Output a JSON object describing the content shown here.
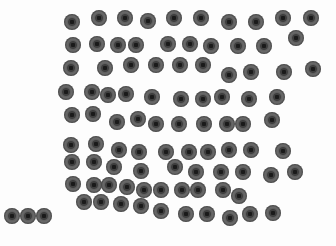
{
  "image": {
    "description": "Top-down photo of dark grey rubber washers/grommets arranged in loose rows on a white background",
    "background_color": "#fdfdfd",
    "washer_color": "#5f5f5f",
    "hole_color": "#1a1a1a",
    "washer_diameter_px": 16,
    "washer_count": 93
  },
  "washers": [
    [
      72,
      22
    ],
    [
      99,
      18
    ],
    [
      125,
      18
    ],
    [
      148,
      21
    ],
    [
      174,
      18
    ],
    [
      201,
      18
    ],
    [
      229,
      22
    ],
    [
      256,
      22
    ],
    [
      283,
      18
    ],
    [
      311,
      18
    ],
    [
      73,
      45
    ],
    [
      97,
      44
    ],
    [
      118,
      45
    ],
    [
      136,
      45
    ],
    [
      168,
      44
    ],
    [
      190,
      44
    ],
    [
      211,
      46
    ],
    [
      238,
      46
    ],
    [
      264,
      46
    ],
    [
      296,
      38
    ],
    [
      71,
      68
    ],
    [
      105,
      68
    ],
    [
      131,
      65
    ],
    [
      156,
      65
    ],
    [
      180,
      65
    ],
    [
      203,
      65
    ],
    [
      229,
      75
    ],
    [
      251,
      72
    ],
    [
      284,
      72
    ],
    [
      313,
      69
    ],
    [
      66,
      92
    ],
    [
      92,
      92
    ],
    [
      108,
      95
    ],
    [
      126,
      94
    ],
    [
      152,
      97
    ],
    [
      181,
      99
    ],
    [
      203,
      99
    ],
    [
      222,
      97
    ],
    [
      249,
      99
    ],
    [
      277,
      97
    ],
    [
      72,
      115
    ],
    [
      93,
      114
    ],
    [
      117,
      122
    ],
    [
      138,
      119
    ],
    [
      156,
      124
    ],
    [
      179,
      124
    ],
    [
      204,
      124
    ],
    [
      227,
      124
    ],
    [
      243,
      124
    ],
    [
      272,
      120
    ],
    [
      71,
      145
    ],
    [
      96,
      144
    ],
    [
      119,
      150
    ],
    [
      139,
      152
    ],
    [
      166,
      152
    ],
    [
      189,
      152
    ],
    [
      208,
      152
    ],
    [
      229,
      150
    ],
    [
      251,
      150
    ],
    [
      283,
      151
    ],
    [
      72,
      162
    ],
    [
      94,
      162
    ],
    [
      114,
      167
    ],
    [
      141,
      171
    ],
    [
      175,
      167
    ],
    [
      196,
      172
    ],
    [
      221,
      172
    ],
    [
      243,
      172
    ],
    [
      271,
      175
    ],
    [
      295,
      172
    ],
    [
      73,
      184
    ],
    [
      94,
      185
    ],
    [
      109,
      185
    ],
    [
      127,
      187
    ],
    [
      144,
      190
    ],
    [
      161,
      190
    ],
    [
      182,
      190
    ],
    [
      198,
      190
    ],
    [
      223,
      190
    ],
    [
      239,
      196
    ],
    [
      84,
      202
    ],
    [
      101,
      202
    ],
    [
      121,
      204
    ],
    [
      141,
      206
    ],
    [
      161,
      211
    ],
    [
      186,
      214
    ],
    [
      207,
      214
    ],
    [
      230,
      218
    ],
    [
      250,
      214
    ],
    [
      273,
      213
    ],
    [
      12,
      216
    ],
    [
      28,
      216
    ],
    [
      44,
      216
    ]
  ]
}
